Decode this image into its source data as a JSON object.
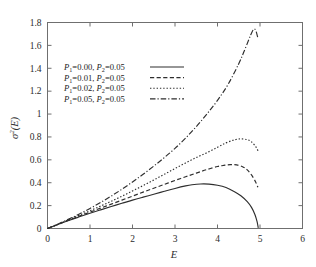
{
  "chart_data": {
    "type": "line",
    "title": "",
    "xlabel": "E",
    "ylabel": "σ²(E)",
    "xlim": [
      0,
      6
    ],
    "ylim": [
      0,
      1.8
    ],
    "grid": false,
    "legend_position": "upper-left-inside",
    "xticks": [
      "0",
      "1",
      "2",
      "3",
      "4",
      "5",
      "6"
    ],
    "xtick_values": [
      0,
      1,
      2,
      3,
      4,
      5,
      6
    ],
    "yticks": [
      "0",
      "0.2",
      "0.4",
      "0.6",
      "0.8",
      "1",
      "1.2",
      "1.4",
      "1.6",
      "1.8"
    ],
    "ytick_values": [
      0,
      0.2,
      0.4,
      0.6,
      0.8,
      1.0,
      1.2,
      1.4,
      1.6,
      1.8
    ],
    "series": [
      {
        "name": "P1=0.00, P2=0.05",
        "legend_p1": "0.00",
        "legend_p2": "0.05",
        "style": "solid",
        "dasharray": "",
        "x": [
          0,
          0.25,
          0.5,
          0.75,
          1.0,
          1.25,
          1.5,
          1.75,
          2.0,
          2.25,
          2.5,
          2.75,
          3.0,
          3.25,
          3.4,
          3.6,
          3.8,
          4.0,
          4.2,
          4.4,
          4.55,
          4.7,
          4.8,
          4.88,
          4.93,
          4.96
        ],
        "values": [
          0,
          0.035,
          0.07,
          0.102,
          0.133,
          0.163,
          0.192,
          0.22,
          0.248,
          0.274,
          0.299,
          0.325,
          0.35,
          0.372,
          0.382,
          0.389,
          0.388,
          0.378,
          0.358,
          0.322,
          0.286,
          0.235,
          0.185,
          0.123,
          0.062,
          0.005
        ]
      },
      {
        "name": "P1=0.01, P2=0.05",
        "legend_p1": "0.01",
        "legend_p2": "0.05",
        "style": "dashed",
        "dasharray": "4.2,2.4",
        "x": [
          0,
          0.25,
          0.5,
          0.75,
          1.0,
          1.25,
          1.5,
          1.75,
          2.0,
          2.25,
          2.5,
          2.75,
          3.0,
          3.25,
          3.5,
          3.75,
          4.0,
          4.15,
          4.3,
          4.45,
          4.6,
          4.7,
          4.8,
          4.9,
          4.95
        ],
        "values": [
          0,
          0.036,
          0.073,
          0.108,
          0.143,
          0.178,
          0.213,
          0.248,
          0.283,
          0.318,
          0.352,
          0.386,
          0.42,
          0.452,
          0.484,
          0.515,
          0.542,
          0.552,
          0.558,
          0.556,
          0.538,
          0.512,
          0.468,
          0.405,
          0.36
        ]
      },
      {
        "name": "P1=0.02, P2=0.05",
        "legend_p1": "0.02",
        "legend_p2": "0.05",
        "style": "dotted",
        "dasharray": "1.4,1.9",
        "x": [
          0,
          0.25,
          0.5,
          0.75,
          1.0,
          1.25,
          1.5,
          1.75,
          2.0,
          2.25,
          2.5,
          2.75,
          3.0,
          3.25,
          3.5,
          3.75,
          4.0,
          4.2,
          4.4,
          4.55,
          4.7,
          4.8,
          4.9,
          4.96
        ],
        "values": [
          0,
          0.038,
          0.077,
          0.116,
          0.155,
          0.196,
          0.238,
          0.282,
          0.328,
          0.375,
          0.424,
          0.474,
          0.524,
          0.573,
          0.62,
          0.662,
          0.71,
          0.748,
          0.775,
          0.783,
          0.776,
          0.757,
          0.715,
          0.675
        ]
      },
      {
        "name": "P1=0.05, P2=0.05",
        "legend_p1": "0.05",
        "legend_p2": "0.05",
        "style": "dashdot",
        "dasharray": "5.5,2,1.2,2",
        "x": [
          0,
          0.25,
          0.5,
          0.75,
          1.0,
          1.25,
          1.5,
          1.75,
          2.0,
          2.25,
          2.5,
          2.75,
          3.0,
          3.25,
          3.5,
          3.75,
          4.0,
          4.25,
          4.5,
          4.65,
          4.78,
          4.85,
          4.9,
          4.95
        ],
        "values": [
          0,
          0.04,
          0.082,
          0.127,
          0.175,
          0.227,
          0.283,
          0.343,
          0.407,
          0.474,
          0.545,
          0.62,
          0.7,
          0.79,
          0.89,
          1.0,
          1.12,
          1.26,
          1.44,
          1.57,
          1.69,
          1.74,
          1.73,
          1.665
        ]
      }
    ]
  },
  "legend": {
    "separator": ", ",
    "equals": "=",
    "p1_symbol": "P",
    "p1_sub": "1",
    "p2_symbol": "P",
    "p2_sub": "2"
  },
  "axis": {
    "x_title": "E",
    "y_title_base": "σ",
    "y_title_sup": "2",
    "y_title_arg": "(E)"
  }
}
